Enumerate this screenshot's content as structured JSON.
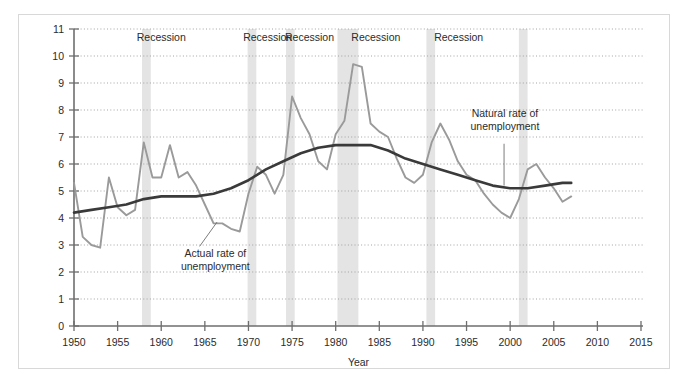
{
  "chart_data": {
    "type": "line",
    "title": "",
    "xlabel": "Year",
    "ylabel": "",
    "xlim": [
      1948,
      2016
    ],
    "ylim": [
      0,
      11
    ],
    "grid": true,
    "legend_position": "inline-annotations",
    "y_ticks": [
      "0",
      "1",
      "2",
      "3",
      "4",
      "5",
      "6",
      "7",
      "8",
      "9",
      "10",
      "11"
    ],
    "x_ticks": [
      "1950",
      "1955",
      "1960",
      "1965",
      "1970",
      "1975",
      "1980",
      "1985",
      "1990",
      "1995",
      "2000",
      "2005",
      "2010",
      "2015"
    ],
    "series": [
      {
        "name": "Actual rate of unemployment",
        "color": "#9a9a9a",
        "x": [
          1950,
          1951,
          1952,
          1953,
          1954,
          1955,
          1956,
          1957,
          1958,
          1959,
          1960,
          1961,
          1962,
          1963,
          1964,
          1965,
          1966,
          1967,
          1968,
          1969,
          1970,
          1971,
          1972,
          1973,
          1974,
          1975,
          1976,
          1977,
          1978,
          1979,
          1980,
          1981,
          1982,
          1983,
          1984,
          1985,
          1986,
          1987,
          1988,
          1989,
          1990,
          1991,
          1992,
          1993,
          1994,
          1995,
          1996,
          1997,
          1998,
          1999,
          2000,
          2001,
          2002,
          2003,
          2004,
          2005,
          2006,
          2007
        ],
        "values": [
          5.3,
          3.3,
          3.0,
          2.9,
          5.5,
          4.4,
          4.1,
          4.3,
          6.8,
          5.5,
          5.5,
          6.7,
          5.5,
          5.7,
          5.2,
          4.5,
          3.8,
          3.8,
          3.6,
          3.5,
          4.9,
          5.9,
          5.6,
          4.9,
          5.6,
          8.5,
          7.7,
          7.1,
          6.1,
          5.8,
          7.1,
          7.6,
          9.7,
          9.6,
          7.5,
          7.2,
          7.0,
          6.2,
          5.5,
          5.3,
          5.6,
          6.8,
          7.5,
          6.9,
          6.1,
          5.6,
          5.4,
          4.9,
          4.5,
          4.2,
          4.0,
          4.7,
          5.8,
          6.0,
          5.5,
          5.1,
          4.6,
          4.8
        ]
      },
      {
        "name": "Natural rate of unemployment",
        "color": "#3a3a3a",
        "x": [
          1950,
          1952,
          1954,
          1956,
          1958,
          1960,
          1962,
          1964,
          1966,
          1968,
          1970,
          1972,
          1974,
          1976,
          1978,
          1980,
          1982,
          1984,
          1986,
          1988,
          1990,
          1992,
          1994,
          1996,
          1998,
          2000,
          2002,
          2004,
          2006,
          2007
        ],
        "values": [
          4.2,
          4.3,
          4.4,
          4.5,
          4.7,
          4.8,
          4.8,
          4.8,
          4.9,
          5.1,
          5.4,
          5.8,
          6.1,
          6.4,
          6.6,
          6.7,
          6.7,
          6.7,
          6.5,
          6.2,
          6.0,
          5.8,
          5.6,
          5.4,
          5.2,
          5.1,
          5.1,
          5.2,
          5.3,
          5.3
        ]
      }
    ],
    "recession_bands": [
      {
        "label": "Recession",
        "start": 1957.8,
        "end": 1958.8
      },
      {
        "label": "Recession",
        "start": 1969.9,
        "end": 1970.9
      },
      {
        "label": "Recession",
        "start": 1974.3,
        "end": 1975.3
      },
      {
        "label": "Recession",
        "start": 1980.2,
        "end": 1982.6
      },
      {
        "label": "Recession",
        "start": 1990.4,
        "end": 1991.4
      },
      {
        "label": "Recession",
        "start": 2001.0,
        "end": 2002.0
      }
    ],
    "recession_labels": [
      {
        "text": "Recession",
        "x": 1960.0,
        "y": 10.55
      },
      {
        "text": "Recession",
        "x": 1972.2,
        "y": 10.55
      },
      {
        "text": "Recession",
        "x": 1977.0,
        "y": 10.55
      },
      {
        "text": "Recession",
        "x": 1984.6,
        "y": 10.55
      },
      {
        "text": "Recession",
        "x": 1994.1,
        "y": 10.55
      }
    ],
    "annotations": [
      {
        "name": "actual-rate-annotation",
        "lines": [
          "Actual rate of",
          "unemployment"
        ],
        "text_x": 1966.2,
        "text_y": 2.55,
        "leader_from_x": 1964.4,
        "leader_from_y": 2.95,
        "leader_to_x": 1966.4,
        "leader_to_y": 3.85
      },
      {
        "name": "natural-rate-annotation",
        "lines": [
          "Natural rate of",
          "unemployment"
        ],
        "text_x": 1999.4,
        "text_y": 7.75,
        "leader_from_x": 1999.3,
        "leader_from_y": 6.75,
        "leader_to_x": 1999.3,
        "leader_to_y": 5.2
      }
    ]
  },
  "colors": {
    "actual_line": "#9a9a9a",
    "natural_line": "#3a3a3a",
    "recession_band": "#e4e4e4",
    "grid": "#9a9a9a",
    "axis": "#6e6e6e",
    "frame": "#d8d8d8",
    "text": "#2b2b2b",
    "background": "#ffffff"
  }
}
